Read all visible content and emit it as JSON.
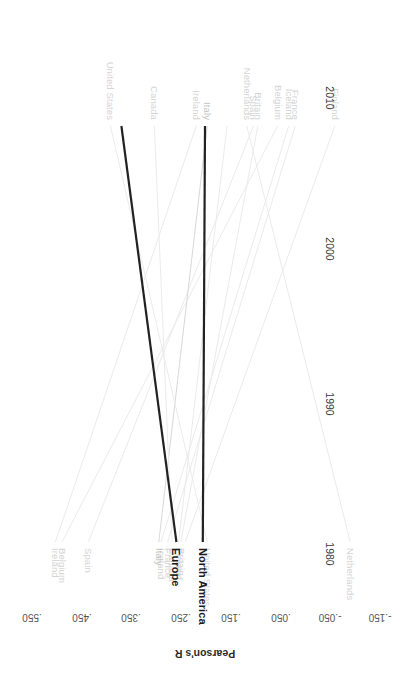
{
  "chart_data": {
    "type": "line",
    "title": "",
    "xlabel": "",
    "ylabel": "Pearson's R",
    "x": [
      1980,
      2010
    ],
    "xticklabels": [
      "1980",
      "1990",
      "2000",
      "2010"
    ],
    "xticks": [
      1980,
      1990,
      2000,
      2010
    ],
    "xlim": [
      1976,
      2014
    ],
    "ylim": [
      -0.15,
      0.6
    ],
    "yticklabels": [
      ".550",
      ".450",
      ".350",
      ".250",
      ".150",
      ".050",
      "-.050",
      "-.150"
    ],
    "yticks": [
      0.55,
      0.45,
      0.35,
      0.25,
      0.15,
      0.05,
      -0.05,
      -0.15
    ],
    "grid": false,
    "legend": "none",
    "series": [
      {
        "name": "Finland",
        "values": [
          0.545,
          0.205
        ],
        "emphasis": "faint",
        "start_label": "Finland",
        "end_label": ""
      },
      {
        "name": "France",
        "values": [
          0.455,
          0.165
        ],
        "emphasis": "faint",
        "start_label": "France",
        "end_label": "France"
      },
      {
        "name": "Iceland",
        "values": [
          0.44,
          0.15
        ],
        "emphasis": "faint",
        "start_label": "Iceland",
        "end_label": "Iceland"
      },
      {
        "name": "Belgium",
        "values": [
          0.415,
          -0.075
        ],
        "emphasis": "faint",
        "start_label": "Belgium",
        "end_label": "Belgium"
      },
      {
        "name": "Britain",
        "values": [
          0.37,
          0.195
        ],
        "emphasis": "faint",
        "start_label": "Britain",
        "end_label": "Britain"
      },
      {
        "name": "Spain",
        "values": [
          0.36,
          -0.015
        ],
        "emphasis": "faint",
        "start_label": "Spain",
        "end_label": "Spain"
      },
      {
        "name": "Netherlands",
        "values": [
          0.345,
          0.58
        ],
        "emphasis": "faint",
        "start_label": "Netherlands",
        "end_label": "Netherlands"
      },
      {
        "name": "Italy",
        "values": [
          0.255,
          0.145
        ],
        "emphasis": "mid",
        "start_label": "Italy",
        "end_label": "Italy"
      },
      {
        "name": "Ireland",
        "values": [
          0.23,
          -0.09
        ],
        "emphasis": "faint",
        "start_label": "Ireland",
        "end_label": "Ireland"
      },
      {
        "name": "Canada",
        "values": [
          0.135,
          0.175
        ],
        "emphasis": "faint",
        "start_label": "Canada",
        "end_label": "Canada"
      },
      {
        "name": "Finland2010",
        "values": [
          0.3,
          0.19
        ],
        "emphasis": "faint",
        "start_label": "",
        "end_label": "Finland"
      },
      {
        "name": "United States",
        "values": [
          0.035,
          0.255
        ],
        "emphasis": "faint",
        "start_label": "United States",
        "end_label": "United States"
      },
      {
        "name": "North America",
        "values": [
          0.25,
          0.245
        ],
        "emphasis": "bold",
        "start_label": "",
        "end_label": "North America"
      },
      {
        "name": "Europe",
        "values": [
          0.06,
          0.185
        ],
        "emphasis": "bold",
        "start_label": "",
        "end_label": "Europe"
      }
    ],
    "colors": {
      "faint": "#ebebeb",
      "mid": "#d8d8d8",
      "bold": "#222222",
      "tick_text": "#555555",
      "label_text": "#9e9e9e",
      "bold_label_text": "#1b1b1b",
      "background": "#ffffff"
    }
  }
}
